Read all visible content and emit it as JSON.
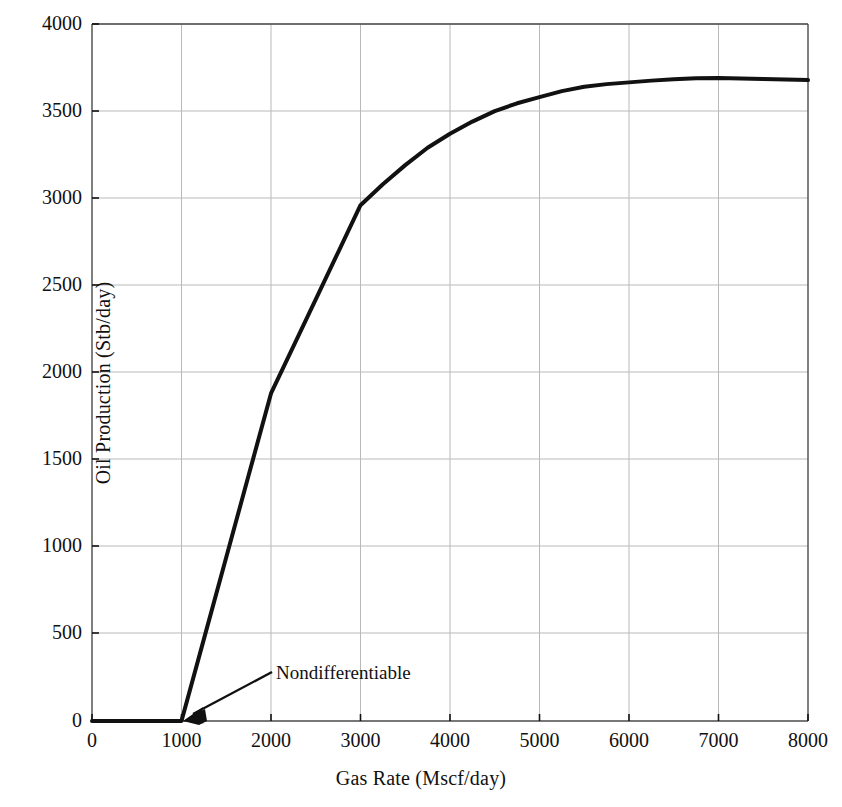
{
  "chart_data": {
    "type": "line",
    "title": "",
    "xlabel": "Gas Rate (Mscf/day)",
    "ylabel": "Oil Production  (Stb/day)",
    "xlim": [
      0,
      8000
    ],
    "ylim": [
      0,
      4000
    ],
    "xticks": [
      0,
      1000,
      2000,
      3000,
      4000,
      5000,
      6000,
      7000,
      8000
    ],
    "xtick_labels": [
      "0",
      "1000",
      "2000",
      "3000",
      "4000",
      "5000",
      "6000",
      "7000",
      "8000"
    ],
    "yticks": [
      0,
      500,
      1000,
      1500,
      2000,
      2500,
      3000,
      3500,
      4000
    ],
    "ytick_labels": [
      "0",
      "500",
      "1000",
      "1500",
      "2000",
      "2500",
      "3000",
      "3500",
      "4000"
    ],
    "grid": true,
    "grid_color": "#b9b9b9",
    "line_color": "#111111",
    "line_width": 4,
    "legend": null,
    "series": [
      {
        "name": "Oil Production",
        "x": [
          0,
          250,
          500,
          750,
          1000,
          1250,
          1500,
          1750,
          2000,
          2250,
          2500,
          2750,
          3000,
          3250,
          3500,
          3750,
          4000,
          4250,
          4500,
          4750,
          5000,
          5250,
          5500,
          5750,
          6000,
          6250,
          6500,
          6750,
          7000,
          7250,
          7500,
          7750,
          8000
        ],
        "y": [
          0,
          0,
          0,
          0,
          0,
          470,
          940,
          1410,
          1880,
          2150,
          2420,
          2690,
          2960,
          3080,
          3190,
          3290,
          3370,
          3440,
          3500,
          3545,
          3580,
          3615,
          3640,
          3655,
          3665,
          3675,
          3683,
          3688,
          3690,
          3687,
          3684,
          3681,
          3678
        ]
      }
    ],
    "annotations": [
      {
        "text": "Nondifferentiable",
        "point_x": 1000,
        "point_y": 0,
        "text_x": 2050,
        "text_y": 330
      }
    ]
  },
  "axes": {
    "xlabel": "Gas Rate (Mscf/day)",
    "ylabel": "Oil Production  (Stb/day)"
  },
  "annotation": {
    "label": "Nondifferentiable"
  }
}
